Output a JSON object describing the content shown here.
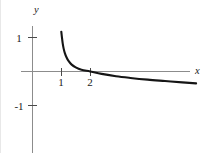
{
  "figure": {
    "background_color": "#ffffff",
    "axis_color": "#8c8c8c",
    "curve_color": "#151515",
    "text_color": "#1a1a1a"
  },
  "labels": {
    "x_axis_name": "x",
    "y_axis_name": "y",
    "x_tick_1": "1",
    "x_tick_2": "2",
    "y_tick_pos1": "1",
    "y_tick_neg1": "-1"
  },
  "chart_data": {
    "type": "line",
    "title": "",
    "xlabel": "x",
    "ylabel": "y",
    "grid": false,
    "legend": null,
    "xlim": [
      -0.9,
      5.6
    ],
    "ylim": [
      -2.4,
      1.9
    ],
    "xticks": [
      1,
      2
    ],
    "xticklabels": [
      "1",
      "2"
    ],
    "yticks": [
      -1,
      1
    ],
    "yticklabels": [
      "-1",
      "1"
    ],
    "axes_origin_px": [
      32.5,
      71.5
    ],
    "px_per_unit_x": 28.8,
    "px_per_unit_y": 34.0,
    "series": [
      {
        "name": "curve",
        "x": [
          1.0,
          1.02,
          1.05,
          1.08,
          1.12,
          1.18,
          1.25,
          1.35,
          1.5,
          1.7,
          2.0,
          2.4,
          2.9,
          3.4,
          4.0,
          4.6,
          5.2,
          5.68
        ],
        "y": [
          1.17,
          1.02,
          0.82,
          0.68,
          0.55,
          0.42,
          0.31,
          0.21,
          0.12,
          0.05,
          0.0,
          -0.07,
          -0.14,
          -0.19,
          -0.24,
          -0.28,
          -0.32,
          -0.35
        ]
      }
    ]
  }
}
